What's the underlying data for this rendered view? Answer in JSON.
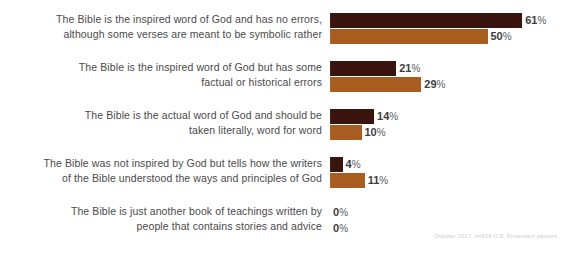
{
  "chart_data": {
    "type": "bar",
    "orientation": "horizontal",
    "title": "",
    "subtitle": "",
    "xlabel": "",
    "ylabel": "",
    "xlim": [
      0,
      61
    ],
    "grid": false,
    "legend": "none",
    "categories": [
      "The Bible is the inspired word of God and has no errors,\nalthough some verses are meant to be symbolic rather",
      "The Bible is the inspired word of God but has some\nfactual or historical errors",
      "The Bible is the actual word of God and should be\ntaken literally, word for word",
      "The Bible was not inspired by God but tells how the writers\nof the Bible understood the ways and principles of God",
      "The Bible is just another book of teachings written by\npeople that contains stories and advice"
    ],
    "series": [
      {
        "name": "series-1",
        "color": "#3a1510",
        "values": [
          61,
          21,
          14,
          4,
          0
        ],
        "labels": [
          "61%",
          "21%",
          "14%",
          "4%",
          "0%"
        ]
      },
      {
        "name": "series-2",
        "color": "#a85c1e",
        "values": [
          50,
          29,
          10,
          11,
          0
        ],
        "labels": [
          "50%",
          "29%",
          "10%",
          "11%",
          "0%"
        ]
      }
    ],
    "annotations": {
      "footnote": "October 2017, n=619 U.S. Protestant pastors"
    },
    "colors": {
      "series_1": "#3a1510",
      "series_2": "#a85c1e",
      "label_text": "#4a4a4a",
      "value_text": "#3d3d3d",
      "footnote_text": "#cfc9c4",
      "background": "#ffffff"
    },
    "scale_px_per_percent": 3.15
  }
}
